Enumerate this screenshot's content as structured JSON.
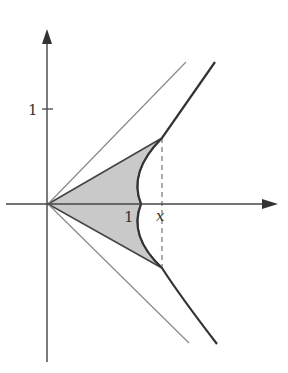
{
  "diagram": {
    "labels": {
      "y_tick": "1",
      "x_tick": "1",
      "x_marker": "x"
    },
    "colors": {
      "axis": "#444444",
      "hyperbola": "#333333",
      "asymptote": "#888888",
      "sector_fill": "#c8c8c8",
      "dashed": "#555555"
    },
    "elements": [
      "x-axis with arrow",
      "y-axis with arrow",
      "asymptote y = x",
      "asymptote y = -x",
      "right branch of hyperbola",
      "shaded sector",
      "dashed vertical line at x"
    ]
  }
}
